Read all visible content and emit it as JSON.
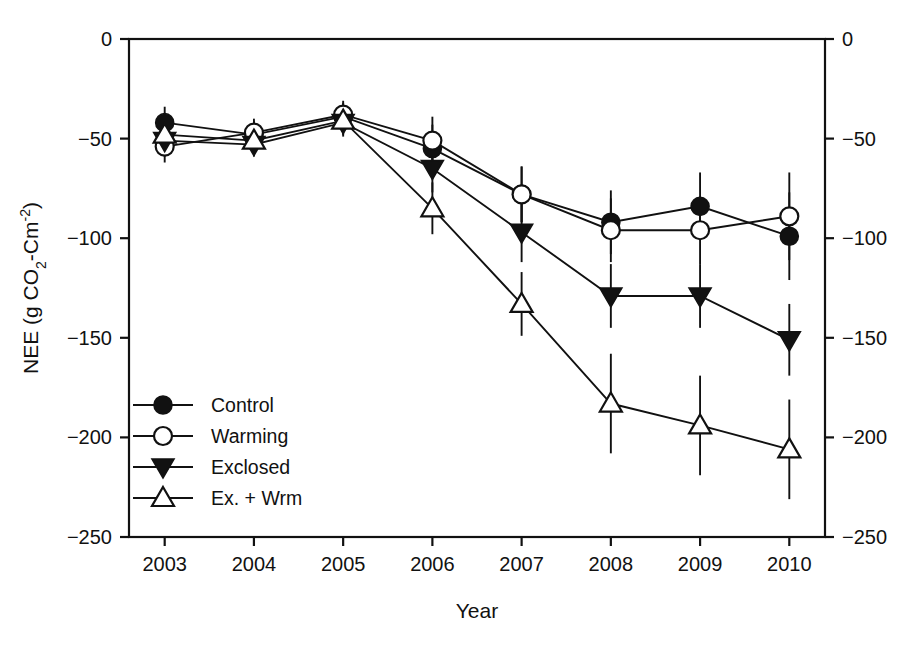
{
  "chart_data": {
    "type": "line",
    "title": "",
    "xlabel": "Year",
    "ylabel": "NEE (g CO2-Cm-2)",
    "ylabel_parts": {
      "prefix": "NEE (g CO",
      "sub1": "2",
      "mid": "-Cm",
      "sup1": "-2",
      "suffix": ")"
    },
    "categories": [
      "2003",
      "2004",
      "2005",
      "2006",
      "2007",
      "2008",
      "2009",
      "2010"
    ],
    "x": [
      2003,
      2004,
      2005,
      2006,
      2007,
      2008,
      2009,
      2010
    ],
    "xlim": [
      2002.6,
      2010.4
    ],
    "ylim": [
      -250,
      0
    ],
    "yticks": [
      0,
      -50,
      -100,
      -150,
      -200,
      -250
    ],
    "ytick_labels": [
      "0",
      "−50",
      "−100",
      "−150",
      "−200",
      "−250"
    ],
    "right_axis": true,
    "right_ytick_labels": [
      "0",
      "−50",
      "−100",
      "−150",
      "−200",
      "−250"
    ],
    "grid": false,
    "legend_position": "lower-left-inside",
    "series": [
      {
        "name": "Control",
        "marker": "filled-circle",
        "values": [
          -42,
          -48,
          -39,
          -55,
          -78,
          -92,
          -84,
          -99
        ],
        "errors": [
          8,
          7,
          7,
          12,
          14,
          16,
          17,
          22
        ]
      },
      {
        "name": "Warming",
        "marker": "open-circle",
        "values": [
          -54,
          -47,
          -38,
          -51,
          -78,
          -96,
          -96,
          -89
        ],
        "errors": [
          8,
          7,
          7,
          12,
          14,
          16,
          17,
          22
        ]
      },
      {
        "name": "Exclosed",
        "marker": "filled-down-triangle",
        "values": [
          -51,
          -53,
          -42,
          -65,
          -97,
          -129,
          -129,
          -151
        ],
        "errors": [
          8,
          6,
          7,
          12,
          15,
          16,
          16,
          18
        ]
      },
      {
        "name": "Ex. + Wrm",
        "marker": "open-up-triangle",
        "values": [
          -48,
          -51,
          -41,
          -85,
          -133,
          -183,
          -194,
          -206
        ],
        "errors": [
          8,
          6,
          7,
          13,
          16,
          25,
          25,
          25
        ]
      }
    ]
  },
  "legend": {
    "entries": [
      {
        "label": "Control",
        "marker": "filled-circle"
      },
      {
        "label": "Warming",
        "marker": "open-circle"
      },
      {
        "label": "Exclosed",
        "marker": "filled-down-triangle"
      },
      {
        "label": "Ex. + Wrm",
        "marker": "open-up-triangle"
      }
    ]
  },
  "colors": {
    "ink": "#111111",
    "background": "#ffffff",
    "marker_fill_open": "#ffffff",
    "marker_fill_solid": "#111111"
  }
}
